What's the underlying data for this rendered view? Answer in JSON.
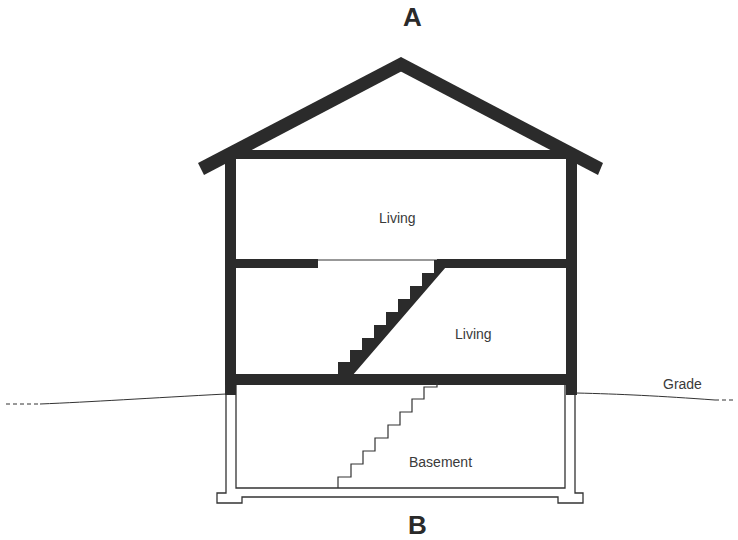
{
  "title_top": "A",
  "title_bottom": "B",
  "rooms": {
    "upper_living": "Living",
    "lower_living": "Living",
    "basement": "Basement"
  },
  "ground_label": "Grade",
  "colors": {
    "wall": "#2b2b2b",
    "line": "#333333",
    "text": "#3a3a3a",
    "background": "#ffffff"
  }
}
